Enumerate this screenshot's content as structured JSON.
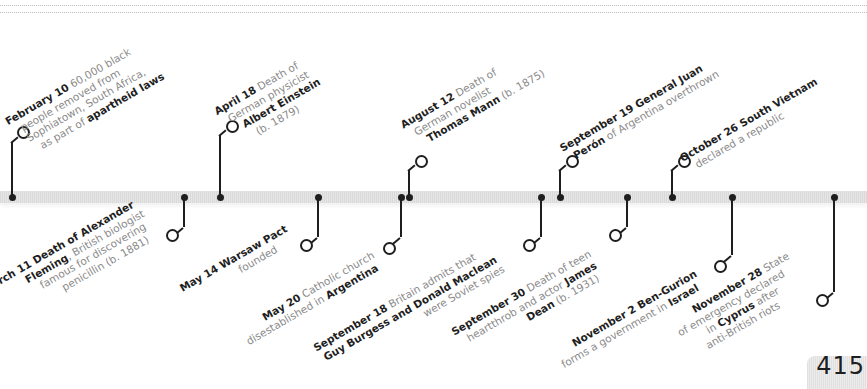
{
  "page": {
    "number": "415"
  },
  "timeline": {
    "bar_color": "#dcdcdc",
    "accent_color": "#1e1e1e",
    "text_muted_color": "#8a8a8a",
    "events_above": [
      {
        "date": "February 10",
        "parts": [
          " 60,000 black",
          "people removed from",
          "Sophiatown, South Africa,",
          "as part of "
        ],
        "bold_tail": "apartheid laws",
        "x": 12
      },
      {
        "date": "April 18",
        "parts": [
          " Death of",
          "German physicist"
        ],
        "bold_line": "Albert Einstein",
        "tail": "(b. 1879)",
        "x": 220
      },
      {
        "date": "August 12",
        "parts": [
          " Death of",
          "German novelist"
        ],
        "bold_line": "Thomas Mann",
        "tail": " (b. 1875)",
        "x": 409
      },
      {
        "date": "September 19",
        "bold_after_date": " General Juan",
        "bold_line": "Perón",
        "tail": " of Argentina overthrown",
        "x": 560
      },
      {
        "date": "October 26",
        "bold_after_date": " South Vietnam",
        "tail": "declared a republic",
        "x": 672
      }
    ],
    "events_below": [
      {
        "date": "March 11",
        "bold_after_date": " Death of Alexander",
        "bold_line": "Fleming",
        "parts": [
          ", British biologist",
          "famous for discovering",
          "penicillin (b. 1881)"
        ],
        "x": 184
      },
      {
        "date": "May 14",
        "bold_after_date": " Warsaw Pact",
        "tail": "founded",
        "x": 318
      },
      {
        "date": "May 20",
        "parts": [
          " Catholic church",
          "disestablished in "
        ],
        "bold_tail": "Argentina",
        "x": 401
      },
      {
        "date": "September 18",
        "parts": [
          " Britain admits that"
        ],
        "bold_line": "Guy Burgess and Donald Maclean",
        "tail": "were Soviet spies",
        "x": 541
      },
      {
        "date": "September 30",
        "parts": [
          " Death of teen",
          "heartthrob and actor "
        ],
        "bold_tail": "James",
        "bold_line": "Dean",
        "tail": " (b. 1931)",
        "x": 627
      },
      {
        "date": "November 2",
        "bold_after_date": " Ben-Gurion",
        "parts": [
          "forms a government in "
        ],
        "bold_tail": "Israel",
        "x": 732
      },
      {
        "date": "November 28",
        "parts": [
          " State",
          "of emergency declared",
          "in "
        ],
        "bold_tail": "Cyprus",
        "tail": " after",
        "tail2": "anti-British riots",
        "x": 834
      }
    ]
  }
}
